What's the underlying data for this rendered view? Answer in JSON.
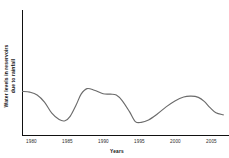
{
  "chart_data": {
    "type": "line",
    "title": "",
    "xlabel": "Years",
    "ylabel": "Water levels in reservoirs due to rainfall",
    "ylabel_line1": "Water levels in reservoirs",
    "ylabel_line2": "due to rainfall",
    "grid": false,
    "legend": false,
    "legend_position": "none",
    "line_color": "#6b6b6b",
    "axis_color": "#111111",
    "background_color": "#ffffff",
    "xlim": [
      1980,
      2007.5
    ],
    "ylim": [
      0,
      100
    ],
    "x_ticks": [
      1980,
      1985,
      1990,
      1995,
      2000,
      2005
    ],
    "x_tick_labels": [
      "1980",
      "1985",
      "1990",
      "1995",
      "2000",
      "2005"
    ],
    "y_ticks": [],
    "y_tick_labels": [],
    "series": [
      {
        "name": "Water level",
        "x": [
          1980.0,
          1981.0,
          1982.0,
          1983.0,
          1984.0,
          1985.0,
          1985.8,
          1986.5,
          1987.3,
          1988.0,
          1988.8,
          1989.8,
          1991.0,
          1992.0,
          1992.8,
          1993.6,
          1994.6,
          1995.4,
          1996.2,
          1997.2,
          1998.4,
          1999.6,
          2000.8,
          2002.0,
          2003.0,
          2004.0,
          2004.8,
          2005.6,
          2006.4,
          2007.4
        ],
        "y": [
          55.5,
          54.5,
          51.0,
          42.0,
          28.0,
          20.0,
          18.5,
          24.0,
          38.0,
          52.0,
          59.0,
          57.0,
          52.5,
          52.0,
          51.0,
          44.0,
          30.0,
          17.5,
          16.5,
          19.5,
          27.0,
          36.0,
          43.5,
          48.5,
          49.5,
          48.0,
          43.0,
          35.0,
          28.5,
          26.0
        ]
      }
    ]
  },
  "axes": {
    "x_axis_name": "years-axis",
    "y_axis_name": "water-level-axis"
  }
}
